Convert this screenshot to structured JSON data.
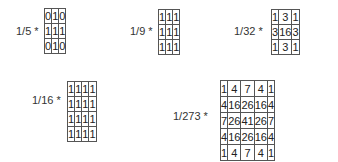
{
  "kernels": [
    {
      "id": "k1",
      "label": "1/5 *",
      "rows": [
        [
          "0",
          "1",
          "0"
        ],
        [
          "1",
          "1",
          "1"
        ],
        [
          "0",
          "1",
          "0"
        ]
      ],
      "layout": {
        "labelX": 16,
        "labelY": 25,
        "gridX": 44,
        "gridY": 8,
        "cellW": 19,
        "cellH": 14
      }
    },
    {
      "id": "k2",
      "label": "1/9 *",
      "rows": [
        [
          "1",
          "1",
          "1"
        ],
        [
          "1",
          "1",
          "1"
        ],
        [
          "1",
          "1",
          "1"
        ]
      ],
      "layout": {
        "labelX": 130,
        "labelY": 25,
        "gridX": 158,
        "gridY": 9,
        "cellW": 19,
        "cellH": 14
      }
    },
    {
      "id": "k3",
      "label": "1/32 *",
      "rows": [
        [
          "1",
          "3",
          "1"
        ],
        [
          "3",
          "16",
          "3"
        ],
        [
          "1",
          "3",
          "1"
        ]
      ],
      "layout": {
        "labelX": 234,
        "labelY": 25,
        "gridX": 271,
        "gridY": 9,
        "cellW": 18,
        "cellH": 14
      }
    },
    {
      "id": "k4",
      "label": "1/16 *",
      "rows": [
        [
          "1",
          "1",
          "1",
          "1"
        ],
        [
          "1",
          "1",
          "1",
          "1"
        ],
        [
          "1",
          "1",
          "1",
          "1"
        ],
        [
          "1",
          "1",
          "1",
          "1"
        ]
      ],
      "layout": {
        "labelX": 32,
        "labelY": 94,
        "gridX": 67,
        "gridY": 81,
        "cellW": 19,
        "cellH": 14
      }
    },
    {
      "id": "k5",
      "label": "1/273 *",
      "rows": [
        [
          "1",
          "4",
          "7",
          "4",
          "1"
        ],
        [
          "4",
          "16",
          "26",
          "16",
          "4"
        ],
        [
          "7",
          "26",
          "41",
          "26",
          "7"
        ],
        [
          "4",
          "16",
          "26",
          "16",
          "4"
        ],
        [
          "1",
          "4",
          "7",
          "4",
          "1"
        ]
      ],
      "layout": {
        "labelX": 173,
        "labelY": 110,
        "gridX": 220,
        "gridY": 80,
        "cellW": 19,
        "cellH": 15
      }
    }
  ]
}
